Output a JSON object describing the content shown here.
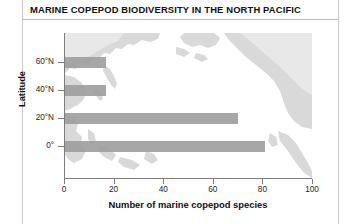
{
  "chart_data": {
    "type": "bar",
    "orientation": "horizontal",
    "title": "MARINE COPEPOD BIODIVERSITY IN THE NORTH PACIFIC",
    "xlabel": "Number of marine copepod species",
    "ylabel": "Latitude",
    "categories": [
      "60°N",
      "40°N",
      "20°N",
      "0°"
    ],
    "values": [
      17,
      17,
      70,
      81
    ],
    "xlim": [
      0,
      100
    ],
    "xticks": [
      "0",
      "20",
      "40",
      "60",
      "80",
      "100"
    ],
    "xtick_values": [
      0,
      20,
      40,
      60,
      80,
      100
    ],
    "yticks": [
      "60°N",
      "40°N",
      "20°N",
      "0°"
    ],
    "grid": false,
    "legend": null,
    "bar_color": "#9b9b9b",
    "background": "grayscale map of the North Pacific",
    "axis_color": "#7d7d7d",
    "text_color": "#111111"
  },
  "figure": {
    "title": "MARINE COPEPOD BIODIVERSITY IN THE NORTH PACIFIC",
    "axis_x_label": "Number of marine copepod species",
    "axis_y_label": "Latitude"
  }
}
